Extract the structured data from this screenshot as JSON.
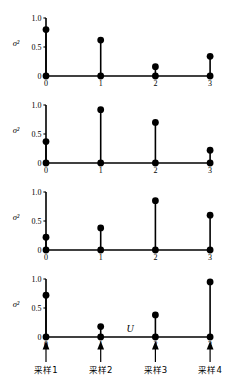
{
  "figure": {
    "title": "",
    "xaxis_label": "U",
    "yaxis_label": "σ²",
    "x_tick_labels": [
      "0",
      "1",
      "2",
      "3"
    ],
    "y_tick_labels": [
      "1.0",
      "0.5",
      "0"
    ],
    "sampling_labels": [
      "采样1",
      "采样2",
      "采样3",
      "采样4"
    ],
    "colors": {
      "line": "#000000",
      "marker": "#000000",
      "background": "#ffffff"
    }
  },
  "chart_data": {
    "type": "line",
    "subtype": "stem",
    "title": "",
    "xlabel": "U",
    "ylabel": "σ²",
    "x": [
      0,
      1,
      2,
      3
    ],
    "xlim": [
      -0.25,
      3.35
    ],
    "ylim": [
      0,
      1.0
    ],
    "yticks": [
      0,
      0.5,
      1.0
    ],
    "ytick_labels": [
      "0",
      "0.5",
      "1.0"
    ],
    "xticks": [
      0,
      1,
      2,
      3
    ],
    "xtick_labels": [
      "0",
      "1",
      "2",
      "3"
    ],
    "grid": false,
    "legend": null,
    "panels": [
      {
        "index": 1,
        "name": "panel-1",
        "ylabel": "σ²",
        "categories": [
          "0",
          "1",
          "2",
          "3"
        ],
        "values": [
          0.8,
          0.62,
          0.16,
          0.34
        ],
        "annotation": "采样1"
      },
      {
        "index": 2,
        "name": "panel-2",
        "ylabel": "σ²",
        "categories": [
          "0",
          "1",
          "2",
          "3"
        ],
        "values": [
          0.37,
          0.92,
          0.7,
          0.22
        ],
        "annotation": "采样2"
      },
      {
        "index": 3,
        "name": "panel-3",
        "ylabel": "σ²",
        "categories": [
          "0",
          "1",
          "2",
          "3"
        ],
        "values": [
          0.22,
          0.38,
          0.85,
          0.6
        ],
        "annotation": "采样3"
      },
      {
        "index": 4,
        "name": "panel-4",
        "ylabel": "σ²",
        "categories": [
          "0",
          "1",
          "2",
          "3"
        ],
        "values": [
          0.72,
          0.18,
          0.38,
          0.95
        ],
        "annotation": "采样4"
      }
    ],
    "annotations": [
      {
        "label": "采样1",
        "x": 0,
        "marker": "up-arrow"
      },
      {
        "label": "采样2",
        "x": 1,
        "marker": "up-arrow"
      },
      {
        "label": "采样3",
        "x": 2,
        "marker": "up-arrow"
      },
      {
        "label": "采样4",
        "x": 3,
        "marker": "up-arrow"
      }
    ]
  }
}
